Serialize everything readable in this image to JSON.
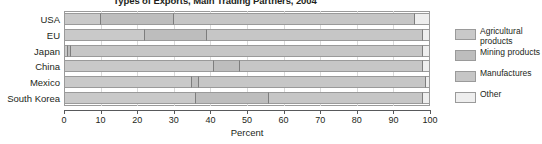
{
  "chart_data": {
    "type": "bar",
    "subtype": "stacked-horizontal-100",
    "title": "Types of Exports, Main Trading Partners, 2004",
    "xlabel": "Percent",
    "ylabel": "",
    "xlim": [
      0,
      100
    ],
    "xticks": [
      0,
      10,
      20,
      30,
      40,
      50,
      60,
      70,
      80,
      90,
      100
    ],
    "xtick_labels": [
      "0",
      "10",
      "20",
      "30",
      "40",
      "50",
      "60",
      "70",
      "80",
      "90",
      "100"
    ],
    "grid": true,
    "legend_position": "right",
    "categories": [
      "USA",
      "EU",
      "Japan",
      "China",
      "Mexico",
      "South Korea"
    ],
    "series": [
      {
        "name": "Agricultural products",
        "color": "#c9c9c9",
        "values": [
          10,
          22,
          1,
          41,
          35,
          36
        ]
      },
      {
        "name": "Mining products",
        "color": "#bdbdbd",
        "values": [
          20,
          17,
          1,
          7,
          2,
          20
        ]
      },
      {
        "name": "Manufactures",
        "color": "#c6c6c6",
        "values": [
          66,
          59,
          96,
          50,
          62,
          42
        ]
      },
      {
        "name": "Other",
        "color": "#eeeeee",
        "values": [
          4,
          2,
          2,
          2,
          1,
          2
        ]
      }
    ],
    "annotations": []
  },
  "legend": {
    "items": [
      {
        "label": "Agricultural products",
        "color": "#c9c9c9"
      },
      {
        "label": "Mining products",
        "color": "#bdbdbd"
      },
      {
        "label": "Manufactures",
        "color": "#c6c6c6"
      },
      {
        "label": "Other",
        "color": "#eeeeee"
      }
    ]
  }
}
